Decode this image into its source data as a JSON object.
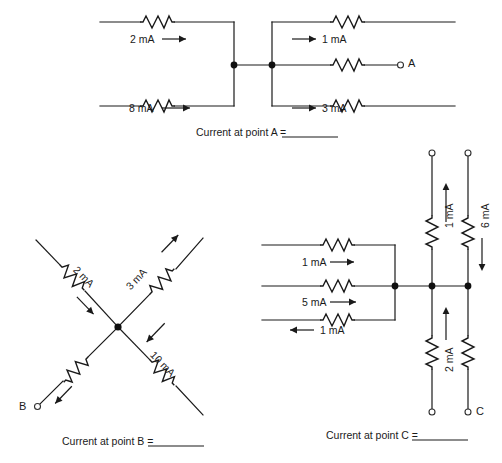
{
  "page": {
    "background": "#ffffff",
    "ink": "#1a1a1a"
  },
  "circuits": [
    {
      "id": "A",
      "caption": "Current at point A =",
      "terminal_label": "A",
      "branches": [
        {
          "name": "top-left-branch",
          "label": "2 mA",
          "direction": "right"
        },
        {
          "name": "bottom-left-branch",
          "label": "8 mA",
          "direction": "right"
        },
        {
          "name": "top-right-branch",
          "label": "1 mA",
          "direction": "right"
        },
        {
          "name": "middle-right-branch",
          "label": "",
          "direction": "right"
        },
        {
          "name": "bottom-right-branch",
          "label": "3 mA",
          "direction": "right"
        }
      ]
    },
    {
      "id": "B",
      "caption": "Current at point B =",
      "terminal_label": "B",
      "branches": [
        {
          "name": "upper-left-branch",
          "label": "2 mA",
          "direction": "toward-node"
        },
        {
          "name": "upper-right-branch",
          "label": "3 mA",
          "direction": "away-from-node"
        },
        {
          "name": "lower-right-branch",
          "label": "10 mA",
          "direction": "toward-node"
        },
        {
          "name": "lower-left-branch",
          "label": "",
          "direction": "away-from-node"
        }
      ]
    },
    {
      "id": "C",
      "caption": "Current at point C =",
      "terminal_label": "C",
      "branches": [
        {
          "name": "top-left-branch",
          "label": "1 mA",
          "direction": "right"
        },
        {
          "name": "middle-left-branch",
          "label": "5 mA",
          "direction": "right"
        },
        {
          "name": "bottom-left-branch",
          "label": "1 mA",
          "direction": "left"
        },
        {
          "name": "upper-inner-branch",
          "label": "1 mA",
          "direction": "up"
        },
        {
          "name": "upper-outer-branch",
          "label": "6 mA",
          "direction": "down"
        },
        {
          "name": "lower-inner-branch",
          "label": "2 mA",
          "direction": "up"
        },
        {
          "name": "lower-outer-branch",
          "label": "",
          "direction": "none"
        }
      ]
    }
  ],
  "captions": {
    "a": "Current at point A =",
    "b": "Current at point B =",
    "c": "Current at point C ="
  },
  "terminals": {
    "a": "A",
    "b": "B",
    "c": "C"
  },
  "labels": {
    "a_2ma": "2 mA",
    "a_8ma": "8 mA",
    "a_1ma": "1 mA",
    "a_3ma": "3 mA",
    "b_2ma": "2 mA",
    "b_3ma": "3 mA",
    "b_10ma": "10 mA",
    "c_1ma_top": "1 mA",
    "c_5ma": "5 mA",
    "c_1ma_bottom": "1 mA",
    "c_1ma_vert": "1 mA",
    "c_6ma_vert": "6 mA",
    "c_2ma_vert": "2 mA"
  }
}
